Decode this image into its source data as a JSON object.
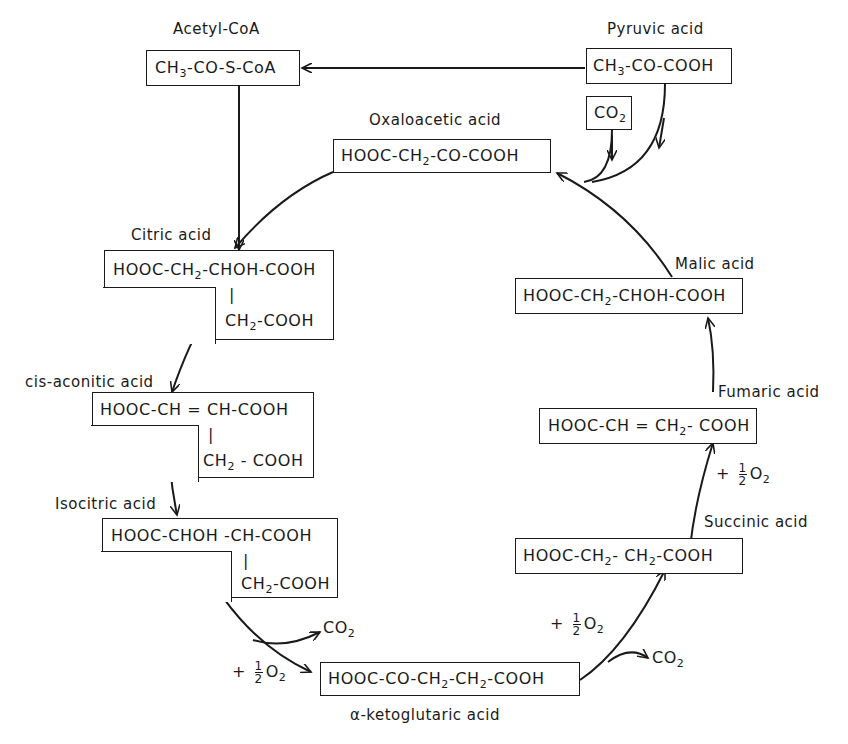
{
  "compounds": {
    "acetyl_coa": {
      "name": "Acetyl-CoA",
      "formula_parts": [
        "CH",
        "3",
        "-CO-S-CoA"
      ]
    },
    "pyruvic": {
      "name": "Pyruvic acid",
      "formula_parts": [
        "CH",
        "3",
        "-CO-COOH"
      ]
    },
    "co2_input": {
      "formula_parts": [
        "CO",
        "2"
      ]
    },
    "oxaloacetic": {
      "name": "Oxaloacetic acid",
      "formula_parts": [
        "HOOC-CH",
        "2",
        "-CO-COOH"
      ]
    },
    "citric": {
      "name": "Citric acid",
      "line1_parts": [
        "HOOC-CH",
        "2",
        "-CHOH-COOH"
      ],
      "branch": "|",
      "line2_parts": [
        "CH",
        "2",
        "-COOH"
      ]
    },
    "cis_aconitic": {
      "name": "cis-aconitic acid",
      "line1": "HOOC-CH = CH-COOH",
      "branch": "|",
      "line2_parts": [
        "CH",
        "2",
        " - COOH"
      ]
    },
    "isocitric": {
      "name": "Isocitric acid",
      "line1": "HOOC-CHOH -CH-COOH",
      "branch": "|",
      "line2_parts": [
        "CH",
        "2",
        "-COOH"
      ]
    },
    "alpha_ketoglutaric": {
      "name": "α-ketoglutaric acid",
      "formula_parts": [
        "HOOC-CO-CH",
        "2",
        "-CH",
        "2",
        "-COOH"
      ]
    },
    "succinic": {
      "name": "Succinic acid",
      "formula_parts": [
        "HOOC-CH",
        "2",
        "- CH",
        "2",
        "-COOH"
      ]
    },
    "fumaric": {
      "name": "Fumaric acid",
      "formula_parts": [
        "HOOC-CH = CH",
        "2",
        "- COOH"
      ]
    },
    "malic": {
      "name": "Malic acid",
      "formula_parts": [
        "HOOC-CH",
        "2",
        "-CHOH-COOH"
      ]
    }
  },
  "side_products": {
    "co2_out_1": {
      "parts": [
        "CO",
        "2"
      ]
    },
    "co2_out_2": {
      "parts": [
        "CO",
        "2"
      ]
    },
    "o2_1": {
      "plus": "+",
      "num": "1",
      "den": "2",
      "o": "O",
      "sub": "2"
    },
    "o2_2": {
      "plus": "+",
      "num": "1",
      "den": "2",
      "o": "O",
      "sub": "2"
    },
    "o2_3": {
      "plus": "+",
      "num": "1",
      "den": "2",
      "o": "O",
      "sub": "2"
    }
  },
  "colors": {
    "ink": "#1a1a1a",
    "background": "#ffffff"
  }
}
